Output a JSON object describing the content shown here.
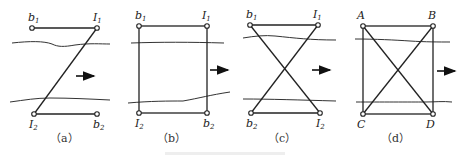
{
  "figure": {
    "panels": [
      {
        "id": "a",
        "caption": "（a）",
        "labels": {
          "top_left": "b",
          "top_left_sub": "1",
          "top_right": "I",
          "top_right_sub": "1",
          "bottom_left": "I",
          "bottom_left_sub": "2",
          "bottom_right": "b",
          "bottom_right_sub": "2"
        },
        "connection": "Z-shape: horizontal top edge, diagonal from top-right to bottom-left, horizontal bottom edge"
      },
      {
        "id": "b",
        "caption": "（b）",
        "labels": {
          "top_left": "b",
          "top_left_sub": "1",
          "top_right": "I",
          "top_right_sub": "1",
          "bottom_left": "I",
          "bottom_left_sub": "2",
          "bottom_right": "b",
          "bottom_right_sub": "2"
        },
        "connection": "rectangle"
      },
      {
        "id": "c",
        "caption": "（c）",
        "labels": {
          "top_left": "b",
          "top_left_sub": "1",
          "top_right": "I",
          "top_right_sub": "1",
          "bottom_left": "b",
          "bottom_left_sub": "2",
          "bottom_right": "I",
          "bottom_right_sub": "2"
        },
        "connection": "hourglass: top and bottom edges with crossing diagonals"
      },
      {
        "id": "d",
        "caption": "（d）",
        "labels": {
          "top_left": "A",
          "top_right": "B",
          "bottom_left": "C",
          "bottom_right": "D"
        },
        "connection": "rectangle with both diagonals"
      }
    ],
    "flow_arrow": "right-arrow",
    "bottom_caption": ""
  }
}
